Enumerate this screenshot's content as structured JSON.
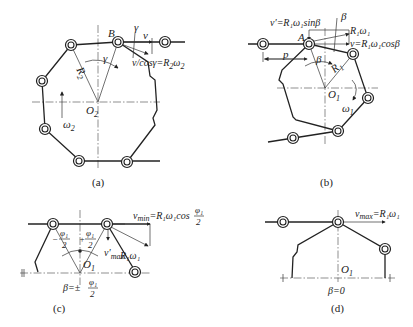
{
  "figure": {
    "panels": [
      {
        "id": "a",
        "caption": "(a)",
        "labels": {
          "point_B": "B",
          "center": "O",
          "center_sub": "2",
          "radius": "R",
          "radius_sub": "2",
          "angle_gamma": "γ",
          "angle_gamma_top": "γ",
          "velocity": "v",
          "velocity_formula": "v/cosγ=R",
          "velocity_formula_sub": "2",
          "velocity_formula_tail": "ω",
          "velocity_formula_tail_sub": "2",
          "omega": "ω",
          "omega_sub": "2"
        }
      },
      {
        "id": "b",
        "caption": "(b)",
        "labels": {
          "point_A": "A",
          "center": "O",
          "center_sub": "1",
          "radius": "R",
          "radius_sub": "1",
          "pitch": "p",
          "angle_beta": "β",
          "angle_beta_top": "β",
          "v_prime_formula": "v′=R₁ω₁sinβ",
          "r1w1": "R₁ω₁",
          "v_formula": "v=R₁ω₁cosβ",
          "omega": "ω",
          "omega_sub": "1"
        }
      },
      {
        "id": "c",
        "caption": "(c)",
        "labels": {
          "vmin_formula": "v",
          "vmin_sub": "min",
          "vmin_rhs": "=R₁ω₁cos",
          "frac_num": "φ₁",
          "frac_den": "2",
          "minus_half_num": "φ₁",
          "minus_half_sign": "−",
          "plus_half_sign": "+",
          "r1w1": "R₁ω₁",
          "vmax_prime": "v′",
          "vmax_prime_sub": "max",
          "center": "O",
          "center_sub": "1",
          "beta_eq": "β=±"
        }
      },
      {
        "id": "d",
        "caption": "(d)",
        "labels": {
          "vmax": "v",
          "vmax_sub": "max",
          "vmax_rhs": "=R₁ω₁",
          "center": "O",
          "center_sub": "1",
          "beta_eq": "β=0"
        }
      }
    ]
  }
}
